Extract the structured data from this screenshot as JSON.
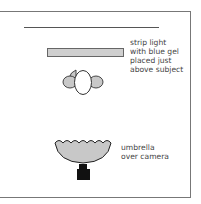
{
  "diagram": {
    "type": "lighting setup (top view)",
    "elements": [
      {
        "name": "background",
        "shape": "line"
      },
      {
        "name": "strip-light",
        "shape": "rectangle",
        "fill": "#cfcfcf"
      },
      {
        "name": "subject",
        "shape": "head with shoulders"
      },
      {
        "name": "umbrella",
        "shape": "scalloped bowl",
        "fill": "#cfcfcf"
      },
      {
        "name": "camera",
        "shape": "block",
        "fill": "#111111"
      }
    ]
  },
  "labels": {
    "strip_light": "strip light\nwith blue gel\nplaced just\nabove subject",
    "umbrella": "umbrella\nover camera"
  }
}
